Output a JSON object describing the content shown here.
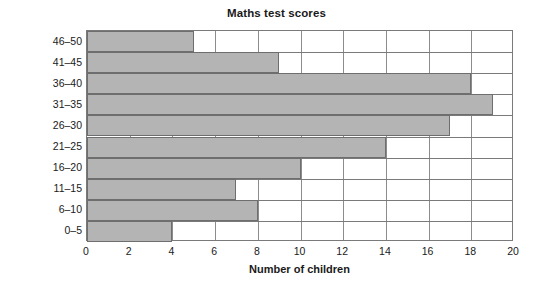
{
  "chart_data": {
    "type": "bar",
    "orientation": "horizontal",
    "title": "Maths test scores",
    "xlabel": "Number of children",
    "ylabel": "Number of correct answers",
    "categories": [
      "0–5",
      "6–10",
      "11–15",
      "16–20",
      "21–25",
      "26–30",
      "31–35",
      "36–40",
      "41–45",
      "46–50"
    ],
    "values": [
      4,
      8,
      7,
      10,
      14,
      17,
      19,
      18,
      9,
      5
    ],
    "xlim": [
      0,
      20
    ],
    "xticks": [
      0,
      2,
      4,
      6,
      8,
      10,
      12,
      14,
      16,
      18,
      20
    ],
    "xtick_labels": [
      "0",
      "2",
      "4",
      "6",
      "8",
      "10",
      "12",
      "14",
      "16",
      "18",
      "20"
    ],
    "grid": "vertical-and-horizontal",
    "legend": "none",
    "bar_fill_color": "#b4b4b4",
    "bar_edge_color": "#6e6e6e",
    "grid_color": "#8c8c8c",
    "axis_color": "#7a7a7a",
    "background_color": "#ffffff",
    "text_color": "#1a1a1a"
  }
}
